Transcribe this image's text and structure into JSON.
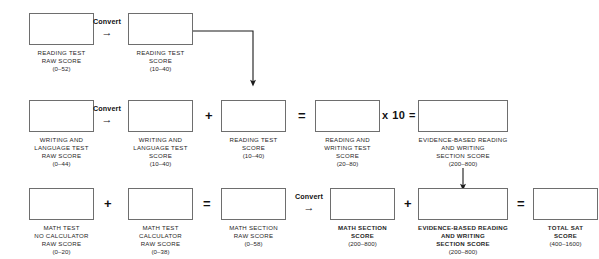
{
  "diagram": {
    "convert_label": "Convert",
    "convert_arrow_glyph": "→",
    "operators": {
      "plus": "+",
      "equals": "=",
      "times_ten": "x 10 ="
    },
    "colors": {
      "box_border": "#6e6e6e",
      "text": "#1a1a1a",
      "connector": "#1a1a1a",
      "background": "#ffffff"
    },
    "rows": [
      {
        "id": "reading-row",
        "nodes": [
          {
            "name": "reading-test-raw-score",
            "lines": [
              "READING TEST",
              "RAW SCORE"
            ],
            "range": "(0–52)",
            "bold": false
          },
          {
            "name": "reading-test-score",
            "lines": [
              "READING TEST",
              "SCORE"
            ],
            "range": "(10–40)",
            "bold": false
          }
        ]
      },
      {
        "id": "writing-row",
        "nodes": [
          {
            "name": "writing-language-test-raw-score",
            "lines": [
              "WRITING AND",
              "LANGUAGE  TEST",
              "RAW SCORE"
            ],
            "range": "(0–44)",
            "bold": false
          },
          {
            "name": "writing-language-test-score",
            "lines": [
              "WRITING AND",
              "LANGUAGE  TEST",
              "SCORE"
            ],
            "range": "(10–40)",
            "bold": false
          },
          {
            "name": "reading-test-score-copy",
            "lines": [
              "READING TEST",
              "SCORE"
            ],
            "range": "(10–40)",
            "bold": false
          },
          {
            "name": "reading-and-writing-test-score",
            "lines": [
              "READING AND",
              "WRITING TEST",
              "SCORE"
            ],
            "range": "(20–80)",
            "bold": false
          },
          {
            "name": "evidence-based-reading-writing-section-score",
            "lines": [
              "EVIDENCE-BASED READING",
              "AND WRITING",
              "SECTION SCORE"
            ],
            "range": "(200–800)",
            "bold": false
          }
        ]
      },
      {
        "id": "math-row",
        "nodes": [
          {
            "name": "math-test-no-calculator-raw-score",
            "lines": [
              "MATH  TEST",
              "NO CALCULATOR",
              "RAW SCORE"
            ],
            "range": "(0–20)",
            "bold": false
          },
          {
            "name": "math-test-calculator-raw-score",
            "lines": [
              "MATH  TEST",
              "CALCULATOR",
              "RAW SCORE"
            ],
            "range": "(0–38)",
            "bold": false
          },
          {
            "name": "math-section-raw-score",
            "lines": [
              "MATH SECTION",
              "RAW SCORE"
            ],
            "range": "(0–58)",
            "bold": false
          },
          {
            "name": "math-section-score",
            "lines": [
              "MATH SECTION",
              "SCORE"
            ],
            "range": "(200–800)",
            "bold": true
          },
          {
            "name": "evidence-based-reading-writing-section-score-total",
            "lines": [
              "EVIDENCE-BASED READING",
              "AND WRITING",
              "SECTION SCORE"
            ],
            "range": "(200–800)",
            "bold": true
          },
          {
            "name": "total-sat-score",
            "lines": [
              "TOTAL SAT",
              "SCORE"
            ],
            "range": "(400–1600)",
            "bold": true
          }
        ]
      }
    ]
  }
}
